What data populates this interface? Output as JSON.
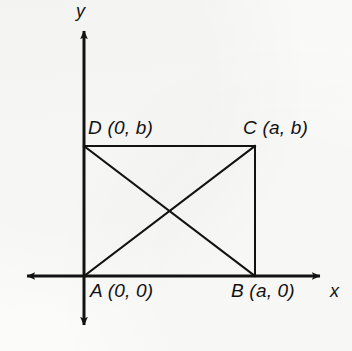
{
  "figure": {
    "kind": "coordinate-geometry-diagram",
    "background_color": "#fbfbfa",
    "ink_color": "#121212"
  },
  "axes": {
    "x_label": "x",
    "y_label": "y",
    "origin_label": "A (0, 0)",
    "x_axis_y_px": 276,
    "y_axis_x_px": 84,
    "x_axis_left_px": 22,
    "x_axis_right_px": 325,
    "y_axis_top_px": 26,
    "y_axis_bottom_px": 330,
    "stroke_width_px": 3,
    "arrowheads": [
      "left",
      "right",
      "up",
      "down"
    ]
  },
  "shape": {
    "name": "rectangle-ABCD",
    "stroke_width_px": 2,
    "vertices": [
      {
        "id": "A",
        "label": "A (0, 0)",
        "coords": "(0, 0)",
        "x_px": 84,
        "y_px": 276
      },
      {
        "id": "B",
        "label": "B (a, 0)",
        "coords": "(a, 0)",
        "x_px": 255,
        "y_px": 276
      },
      {
        "id": "C",
        "label": "C (a, b)",
        "coords": "(a, b)",
        "x_px": 255,
        "y_px": 146
      },
      {
        "id": "D",
        "label": "D (0, b)",
        "coords": "(0, b)",
        "x_px": 84,
        "y_px": 146
      }
    ],
    "edges": [
      {
        "id": "AB",
        "from": "A",
        "to": "B"
      },
      {
        "id": "BC",
        "from": "B",
        "to": "C"
      },
      {
        "id": "CD",
        "from": "C",
        "to": "D"
      },
      {
        "id": "DA",
        "from": "D",
        "to": "A"
      }
    ],
    "diagonals": [
      {
        "id": "AC",
        "from": "A",
        "to": "C"
      },
      {
        "id": "DB",
        "from": "D",
        "to": "B"
      }
    ],
    "diagonal_intersection": {
      "x_px": 170,
      "y_px": 211
    }
  }
}
